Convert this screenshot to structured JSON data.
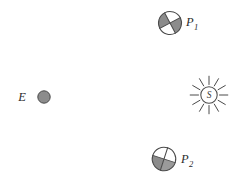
{
  "diagram": {
    "background_color": "#ffffff",
    "width": 233,
    "height": 190,
    "stroke_color": "#4a4a4a",
    "shade_color": "#8c8c8c",
    "label_color": "#2b2b2b",
    "bodies": [
      {
        "id": "earth",
        "label": "E",
        "subscript": "",
        "icon": "filled-circle-icon",
        "label_x": 22,
        "label_y": 101,
        "cx": 44,
        "cy": 97,
        "r": 6.2,
        "fill": "#8c8c8c"
      },
      {
        "id": "planet-1",
        "label": "P",
        "subscript": "1",
        "icon": "quartered-circle-icon",
        "label_x": 186,
        "label_y": 26,
        "sub_x": 194,
        "sub_y": 30,
        "cx": 170,
        "cy": 23,
        "r": 11.5,
        "rotation": -28,
        "shaded_quadrants": "upper-left-and-lower-right",
        "fill": "#8c8c8c"
      },
      {
        "id": "sun",
        "label": "S",
        "subscript": "",
        "icon": "sun-icon",
        "glyph_x": 209,
        "glyph_y": 99,
        "cx": 209,
        "cy": 95,
        "r": 8.2,
        "ray_count": 12,
        "ray_inner": 10.5,
        "ray_outer": 18.5
      },
      {
        "id": "planet-2",
        "label": "P",
        "subscript": "2",
        "icon": "quartered-circle-icon",
        "label_x": 181,
        "label_y": 163,
        "sub_x": 189,
        "sub_y": 167,
        "cx": 164,
        "cy": 159,
        "r": 11.8,
        "rotation": 18,
        "shaded_quadrants": "left-and-bottom",
        "fill": "#8c8c8c"
      }
    ]
  }
}
